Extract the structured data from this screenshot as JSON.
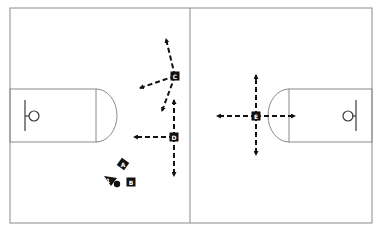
{
  "diagram": {
    "type": "basketball-court-play",
    "colors": {
      "background": "#ffffff",
      "court_lines": "#8a8a8a",
      "players": "#111111",
      "arrows": "#111111"
    },
    "players": [
      {
        "id": "A",
        "label": "A",
        "x": 123,
        "y": 164,
        "shape": "diamond"
      },
      {
        "id": "B",
        "label": "B",
        "x": 131,
        "y": 182,
        "shape": "square"
      },
      {
        "id": "C",
        "label": "C",
        "x": 175,
        "y": 76,
        "shape": "square"
      },
      {
        "id": "D",
        "label": "D",
        "x": 174,
        "y": 137,
        "shape": "square"
      },
      {
        "id": "E",
        "label": "E",
        "x": 256,
        "y": 116,
        "shape": "square"
      }
    ],
    "ball_handler": {
      "label": "1",
      "x": 110,
      "y": 180
    },
    "ball": {
      "x": 117,
      "y": 184
    },
    "movements": [
      {
        "from": "C",
        "to": [
          166,
          39
        ]
      },
      {
        "from": "C",
        "to": [
          140,
          88
        ]
      },
      {
        "from": "C",
        "to": [
          162,
          111
        ]
      },
      {
        "from": "D",
        "to": [
          174,
          100
        ]
      },
      {
        "from": "D",
        "to": [
          134,
          137
        ]
      },
      {
        "from": "D",
        "to": [
          174,
          176
        ]
      },
      {
        "from": "E",
        "to": [
          256,
          75
        ]
      },
      {
        "from": "E",
        "to": [
          256,
          155
        ]
      },
      {
        "from": "E",
        "to": [
          217,
          116
        ]
      },
      {
        "from": "E",
        "to": [
          295,
          116
        ]
      }
    ]
  }
}
